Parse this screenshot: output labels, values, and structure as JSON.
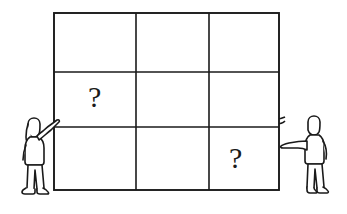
{
  "illustration": {
    "title": "Blind men and the elephant grid illustration",
    "description": "Line drawing of a large elephant behind a 3x3 grid frame, with two people standing on either side pointing at it, and two question marks inside grid cells.",
    "colors": {
      "ink": "#1a1a1a",
      "background": "#ffffff",
      "fill": "#ffffff"
    },
    "grid": {
      "name": "3x3-grid-frame",
      "columns": 3,
      "rows": 3,
      "bounds": {
        "x": 54,
        "y": 13,
        "width": 225,
        "height": 177
      },
      "vertical_lines_x": [
        136,
        209
      ],
      "horizontal_lines_y": [
        72,
        127
      ],
      "cells": [
        {
          "row": 1,
          "col": 1,
          "label": ""
        },
        {
          "row": 1,
          "col": 2,
          "label": ""
        },
        {
          "row": 1,
          "col": 3,
          "label": ""
        },
        {
          "row": 2,
          "col": 1,
          "label": "?"
        },
        {
          "row": 2,
          "col": 2,
          "label": ""
        },
        {
          "row": 2,
          "col": 3,
          "label": ""
        },
        {
          "row": 3,
          "col": 1,
          "label": ""
        },
        {
          "row": 3,
          "col": 2,
          "label": ""
        },
        {
          "row": 3,
          "col": 3,
          "label": "?"
        }
      ]
    },
    "question_marks": [
      {
        "name": "question-mark-left",
        "text": "?",
        "x": 88,
        "y": 106,
        "size": 30
      },
      {
        "name": "question-mark-right",
        "text": "?",
        "x": 229,
        "y": 167,
        "size": 30
      }
    ],
    "elephant": {
      "name": "elephant",
      "facing": "right",
      "parts": [
        "back",
        "head",
        "ear",
        "eye",
        "tusk",
        "trunk",
        "front-legs",
        "hind-legs",
        "belly",
        "tail"
      ]
    },
    "people": [
      {
        "name": "person-left",
        "side": "left",
        "pose": "arm-raised-touching-board",
        "hair": "long",
        "x": 20,
        "y": 120
      },
      {
        "name": "person-right",
        "side": "right",
        "pose": "arm-extended-pointing-left",
        "hair": "short",
        "x": 288,
        "y": 120
      }
    ]
  }
}
